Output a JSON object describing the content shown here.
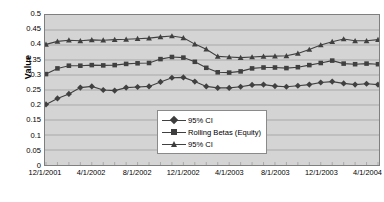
{
  "chart_data": {
    "type": "line",
    "title": "",
    "xlabel": "",
    "ylabel": "Value",
    "ylim": [
      0,
      0.5
    ],
    "ytick_labels": [
      "0.5",
      "0.45",
      "0.4",
      "0.35",
      "0.3",
      "0.25",
      "0.2",
      "0.15",
      "0.1",
      "0.05",
      "0"
    ],
    "ytick_values": [
      0.5,
      0.45,
      0.4,
      0.35,
      0.3,
      0.25,
      0.2,
      0.15,
      0.1,
      0.05,
      0
    ],
    "grid": true,
    "legend_position": "inside-lower-center",
    "plot_bgcolor": "#d4d4d4",
    "gridline_color": "#a8a8a8",
    "series_color": "#404040",
    "x": [
      "12/1/2001",
      "1/1/2002",
      "2/1/2002",
      "3/1/2002",
      "4/1/2002",
      "5/1/2002",
      "6/1/2002",
      "7/1/2002",
      "8/1/2002",
      "9/1/2002",
      "10/1/2002",
      "11/1/2002",
      "12/1/2002",
      "1/1/2003",
      "2/1/2003",
      "3/1/2003",
      "4/1/2003",
      "5/1/2003",
      "6/1/2003",
      "7/1/2003",
      "8/1/2003",
      "9/1/2003",
      "10/1/2003",
      "11/1/2003",
      "12/1/2003",
      "1/1/2004",
      "2/1/2004",
      "3/1/2004",
      "4/1/2004",
      "5/1/2004"
    ],
    "xtick_labels": [
      "12/1/2001",
      "4/1/2002",
      "8/1/2002",
      "12/1/2002",
      "4/1/2003",
      "8/1/2003",
      "12/1/2003",
      "4/1/2004"
    ],
    "xtick_indices": [
      0,
      4,
      8,
      12,
      16,
      20,
      24,
      28
    ],
    "series": [
      {
        "name": "95% CI",
        "marker": "diamond",
        "role": "lower-confidence-bound",
        "values": [
          0.202,
          0.222,
          0.237,
          0.258,
          0.262,
          0.25,
          0.248,
          0.258,
          0.26,
          0.262,
          0.277,
          0.291,
          0.292,
          0.278,
          0.262,
          0.257,
          0.257,
          0.261,
          0.267,
          0.268,
          0.263,
          0.261,
          0.264,
          0.268,
          0.275,
          0.278,
          0.272,
          0.268,
          0.271,
          0.268
        ]
      },
      {
        "name": "Rolling Betas (Equity)",
        "marker": "square",
        "role": "point-estimate",
        "values": [
          0.303,
          0.322,
          0.331,
          0.331,
          0.333,
          0.332,
          0.333,
          0.337,
          0.339,
          0.34,
          0.353,
          0.36,
          0.358,
          0.344,
          0.324,
          0.309,
          0.308,
          0.312,
          0.322,
          0.325,
          0.325,
          0.323,
          0.326,
          0.333,
          0.34,
          0.348,
          0.338,
          0.336,
          0.338,
          0.336
        ]
      },
      {
        "name": "95% CI",
        "marker": "triangle",
        "role": "upper-confidence-bound",
        "values": [
          0.402,
          0.412,
          0.416,
          0.414,
          0.417,
          0.416,
          0.418,
          0.419,
          0.421,
          0.423,
          0.427,
          0.43,
          0.424,
          0.403,
          0.386,
          0.362,
          0.36,
          0.358,
          0.36,
          0.362,
          0.363,
          0.364,
          0.372,
          0.385,
          0.4,
          0.411,
          0.42,
          0.414,
          0.414,
          0.418
        ]
      }
    ]
  },
  "legend": {
    "items": [
      {
        "label": "95% CI",
        "marker": "diamond"
      },
      {
        "label": "Rolling Betas (Equity)",
        "marker": "square"
      },
      {
        "label": "95% CI",
        "marker": "triangle"
      }
    ]
  }
}
